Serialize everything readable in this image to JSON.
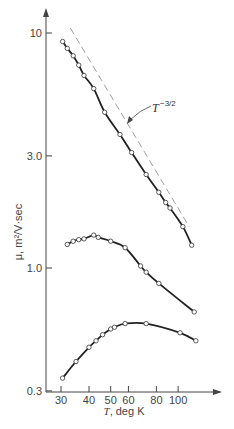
{
  "chart_data": {
    "type": "line",
    "title": "",
    "xlabel": "T, deg K",
    "ylabel": "μ, m²/V·sec",
    "xscale": "log",
    "yscale": "log",
    "xlim": [
      27,
      135
    ],
    "ylim": [
      0.3,
      12
    ],
    "x_ticks": [
      30,
      40,
      50,
      60,
      80,
      100
    ],
    "x_tick_labels": [
      "30",
      "40",
      "50",
      "60",
      "80",
      "100"
    ],
    "y_ticks": [
      0.3,
      1.0,
      3.0,
      10
    ],
    "y_tick_labels": [
      "0.3",
      "1.0",
      "3.0",
      "10"
    ],
    "grid": false,
    "legend": null,
    "annotations": [
      {
        "text": "T^-3/2",
        "label": "T",
        "exponent": "−3/2",
        "points_to": "dashed reference line"
      }
    ],
    "series": [
      {
        "name": "upper curve",
        "style": "solid line with open circle markers",
        "x": [
          30.5,
          32,
          34,
          36,
          38,
          42,
          47,
          55,
          62,
          72,
          82,
          88,
          92,
          105,
          115
        ],
        "y": [
          9.2,
          8.6,
          8.0,
          7.3,
          6.6,
          5.8,
          4.6,
          3.7,
          3.1,
          2.5,
          2.1,
          1.9,
          1.8,
          1.5,
          1.25
        ]
      },
      {
        "name": "middle curve",
        "style": "solid line with open circle markers",
        "x": [
          32,
          34,
          36,
          38,
          42,
          44,
          50,
          58,
          68,
          72,
          82,
          118
        ],
        "y": [
          1.26,
          1.3,
          1.32,
          1.33,
          1.38,
          1.35,
          1.3,
          1.22,
          1.02,
          0.96,
          0.86,
          0.65
        ]
      },
      {
        "name": "lower curve",
        "style": "solid line with open circle markers",
        "x": [
          30.5,
          35,
          40,
          43,
          46,
          50,
          52,
          58,
          72,
          102,
          120
        ],
        "y": [
          0.34,
          0.4,
          0.46,
          0.49,
          0.52,
          0.55,
          0.56,
          0.58,
          0.58,
          0.53,
          0.49
        ]
      },
      {
        "name": "T^-3/2 reference",
        "style": "dashed line, no markers",
        "x": [
          33,
          112
        ],
        "y": [
          10.5,
          1.5
        ]
      }
    ]
  },
  "labels": {
    "x_axis_title_var": "T",
    "x_axis_title_rest": ", deg K",
    "y_axis_title": "μ, m²/V·sec",
    "annotation_base": "T",
    "annotation_exp": "−3/2"
  }
}
